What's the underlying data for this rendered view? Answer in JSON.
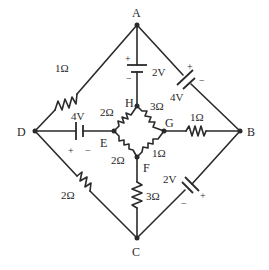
{
  "diagram": {
    "type": "circuit",
    "nodes": {
      "A": {
        "label": "A"
      },
      "B": {
        "label": "B"
      },
      "C": {
        "label": "C"
      },
      "D": {
        "label": "D"
      },
      "E": {
        "label": "E"
      },
      "F": {
        "label": "F"
      },
      "G": {
        "label": "G"
      },
      "H": {
        "label": "H"
      }
    },
    "components": {
      "r_DA": {
        "label": "1Ω",
        "between": [
          "D",
          "A"
        ]
      },
      "bat_AH": {
        "label": "2V",
        "plus": "+",
        "minus": "−",
        "between": [
          "A",
          "H"
        ],
        "positive_side": "A"
      },
      "bat_AB": {
        "label": "4V",
        "plus": "+",
        "minus": "−",
        "between": [
          "A",
          "B"
        ],
        "positive_side": "A"
      },
      "bat_DE": {
        "label": "4V",
        "plus": "+",
        "minus": "−",
        "between": [
          "D",
          "E"
        ],
        "positive_side": "D"
      },
      "r_EH": {
        "label": "2Ω",
        "between": [
          "E",
          "H"
        ]
      },
      "r_HG": {
        "label": "3Ω",
        "between": [
          "H",
          "G"
        ]
      },
      "r_EF": {
        "label": "2Ω",
        "between": [
          "E",
          "F"
        ]
      },
      "r_FG": {
        "label": "1Ω",
        "between": [
          "F",
          "G"
        ]
      },
      "r_GB": {
        "label": "1Ω",
        "between": [
          "G",
          "B"
        ]
      },
      "r_FC": {
        "label": "3Ω",
        "between": [
          "F",
          "C"
        ]
      },
      "r_DC": {
        "label": "2Ω",
        "between": [
          "D",
          "C"
        ]
      },
      "bat_CB": {
        "label": "2V",
        "plus": "+",
        "minus": "−",
        "between": [
          "C",
          "B"
        ],
        "positive_side": "B"
      }
    }
  }
}
